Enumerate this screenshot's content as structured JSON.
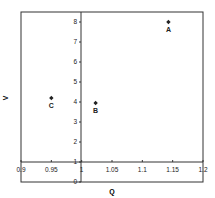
{
  "chart_data": {
    "type": "scatter",
    "title": "",
    "xlabel": "Q",
    "ylabel": "V",
    "xlim": [
      0.9,
      1.2
    ],
    "ylim": [
      0,
      8.5
    ],
    "x_ticks": [
      "0.9",
      "0.95",
      "1",
      "1.05",
      "1.1",
      "1.15",
      "1.2"
    ],
    "y_ticks": [
      "0",
      "1",
      "2",
      "3",
      "4",
      "5",
      "6",
      "7",
      "8"
    ],
    "x_axis_crosses_at_y": 1,
    "y_axis_crosses_at_x": 1.0,
    "grid": false,
    "legend": null,
    "points": [
      {
        "label": "A",
        "x": 1.143,
        "y": 8.0
      },
      {
        "label": "B",
        "x": 1.023,
        "y": 3.95
      },
      {
        "label": "C",
        "x": 0.95,
        "y": 4.2
      }
    ]
  },
  "colors": {
    "axis": "#333333",
    "marker": "#222222",
    "text": "#222222"
  }
}
